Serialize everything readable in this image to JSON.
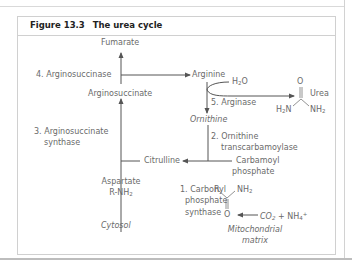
{
  "figure": {
    "number": "Figure 13.3",
    "title": "The urea cycle"
  },
  "metabolites": {
    "fumarate": "Fumarate",
    "arginine": "Arginine",
    "argininosuccinate": "Arginosuccinate",
    "ornithine": "Ornithine",
    "citrulline": "Citrulline",
    "carbamoyl_phosphate_line1": "Carbamoyl",
    "carbamoyl_phosphate_line2": "phosphate",
    "aspartate": "Aspartate",
    "aspartate_formula": "R-NH",
    "aspartate_formula_sub": "2",
    "water": "H",
    "water_sub": "2",
    "water_suffix": "O",
    "urea": "Urea",
    "urea_o": "O",
    "urea_left": "H",
    "urea_left_sub": "2",
    "urea_left_suffix": "N",
    "urea_right": "NH",
    "urea_right_sub": "2",
    "cp_r": "R",
    "cp_nh2": "NH",
    "cp_nh2_sub": "2",
    "cp_o": "O",
    "co2": "CO",
    "co2_sub": "2",
    "co2_plus": " + NH",
    "nh4_sub": "4",
    "nh4_sup": "+"
  },
  "enzymes": {
    "step1_line1": "1. Carbonyl",
    "step1_line2": "phosphate",
    "step1_line3": "synthase",
    "step2_line1": "2. Ornithine",
    "step2_line2": "transcarbamoylase",
    "step3_line1": "3. Arginosuccinate",
    "step3_line2": "synthase",
    "step4": "4. Arginosuccinase",
    "step5": "5. Arginase"
  },
  "compartments": {
    "cytosol": "Cytosol",
    "mito_line1": "Mitochondrial",
    "mito_line2": "matrix"
  },
  "colors": {
    "line": "#555555",
    "text": "#6a6a6a",
    "border": "#d0d0d0"
  }
}
